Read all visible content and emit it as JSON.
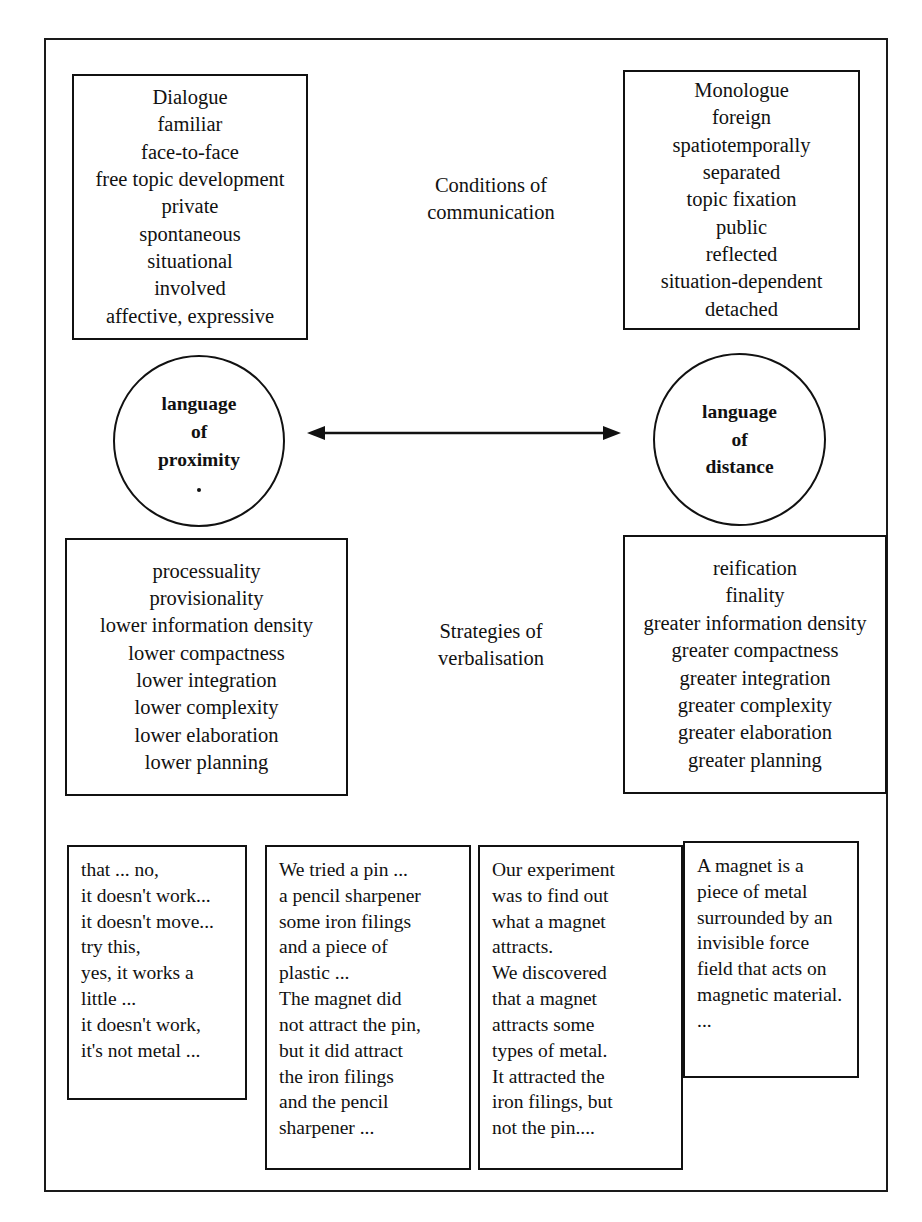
{
  "figure": {
    "ink_color": "#111111",
    "background_color": "#ffffff"
  },
  "axis_labels": {
    "conditions": "Conditions of\ncommunication",
    "conditions_lines": [
      "Conditions of",
      "communication"
    ],
    "strategies": "Strategies of\nverbalisation",
    "strategies_lines": [
      "Strategies of",
      "verbalisation"
    ]
  },
  "poles": {
    "proximity": {
      "label_lines": [
        "language",
        "of",
        "proximity"
      ],
      "label": "language of proximity"
    },
    "distance": {
      "label_lines": [
        "language",
        "of",
        "distance"
      ],
      "label": "language of distance"
    }
  },
  "conditions_of_communication": {
    "proximity": {
      "heading": "Dialogue",
      "items": [
        "Dialogue",
        "familiar",
        "face-to-face",
        "free topic development",
        "private",
        "spontaneous",
        "situational",
        "involved",
        "affective, expressive"
      ]
    },
    "distance": {
      "heading": "Monologue",
      "items": [
        "Monologue",
        "foreign",
        "spatiotemporally",
        "separated",
        "topic fixation",
        "public",
        "reflected",
        "situation-dependent",
        "detached"
      ]
    }
  },
  "strategies_of_verbalisation": {
    "proximity": {
      "items": [
        "processuality",
        "provisionality",
        "lower information density",
        "lower compactness",
        "lower integration",
        "lower complexity",
        "lower elaboration",
        "lower planning"
      ]
    },
    "distance": {
      "items": [
        "reification",
        "finality",
        "greater information density",
        "greater compactness",
        "greater integration",
        "greater complexity",
        "greater elaboration",
        "greater planning"
      ]
    }
  },
  "samples": [
    {
      "id": "sample-1",
      "lines": [
        "that ... no,",
        "it doesn't work...",
        "it doesn't move...",
        "try this,",
        "yes, it works a",
        "little ...",
        "it doesn't work,",
        "it's not metal ..."
      ]
    },
    {
      "id": "sample-2",
      "lines": [
        "We tried a pin ...",
        "a pencil sharpener",
        "some iron filings",
        "and a piece of",
        "plastic ...",
        "The magnet did",
        "not attract the pin,",
        "but it did attract",
        "the iron filings",
        "and the pencil",
        "sharpener ..."
      ]
    },
    {
      "id": "sample-3",
      "lines": [
        "Our experiment",
        "was to find out",
        "what a magnet",
        "attracts.",
        "We discovered",
        "that a magnet",
        "attracts some",
        "types of metal.",
        "It attracted the",
        "iron filings, but",
        "not the pin...."
      ]
    },
    {
      "id": "sample-4",
      "lines": [
        "A magnet is a",
        "piece of metal",
        "surrounded by an",
        "invisible force",
        "field that acts on",
        "magnetic material.",
        "..."
      ]
    }
  ],
  "arrow": {
    "name": "double-headed-arrow",
    "direction": "bidirectional-horizontal"
  }
}
